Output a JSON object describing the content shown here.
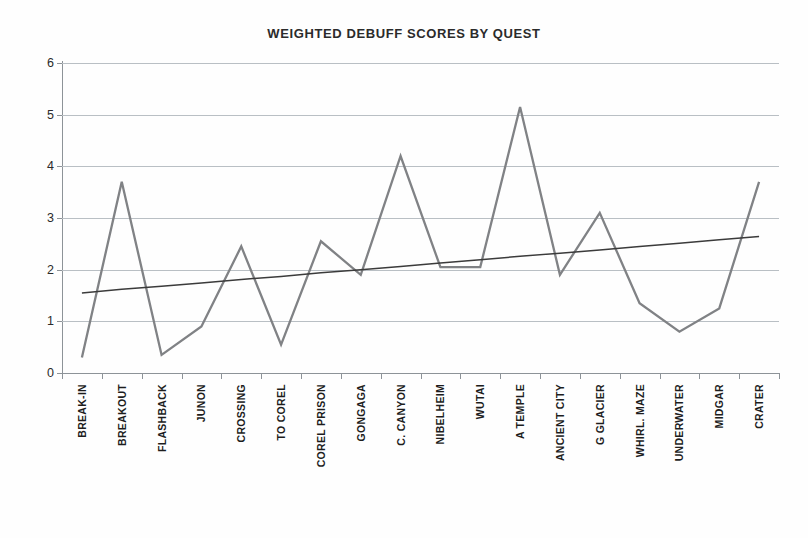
{
  "chart_data": {
    "type": "line",
    "title": "WEIGHTED DEBUFF SCORES BY QUEST",
    "xlabel": "",
    "ylabel": "",
    "ylim": [
      0,
      6
    ],
    "yticks": [
      0,
      1,
      2,
      3,
      4,
      5,
      6
    ],
    "ytick_labels": [
      "0",
      "1",
      "2",
      "3",
      "4",
      "5",
      "6"
    ],
    "grid": true,
    "legend": "none",
    "categories": [
      "BREAK-IN",
      "BREAKOUT",
      "FLASHBACK",
      "JUNON",
      "CROSSING",
      "TO COREL",
      "COREL PRISON",
      "GONGAGA",
      "C. CANYON",
      "NIBELHEIM",
      "WUTAI",
      "A TEMPLE",
      "ANCIENT  CITY",
      "G GLACIER",
      "WHIRL. MAZE",
      "UNDERWATER",
      "MIDGAR",
      "CRATER"
    ],
    "series": [
      {
        "name": "Weighted debuff score",
        "color": "#808285",
        "values": [
          0.3,
          3.7,
          0.35,
          0.9,
          2.45,
          0.55,
          2.55,
          1.9,
          4.2,
          2.05,
          2.05,
          5.15,
          1.9,
          3.1,
          1.35,
          0.8,
          1.25,
          3.7
        ]
      },
      {
        "name": "Linear trend",
        "color": "#3b3b3b",
        "kind": "trendline",
        "values": [
          1.55,
          1.62,
          1.68,
          1.74,
          1.81,
          1.87,
          1.94,
          2.0,
          2.06,
          2.13,
          2.19,
          2.26,
          2.32,
          2.38,
          2.45,
          2.51,
          2.58,
          2.64
        ]
      }
    ]
  }
}
